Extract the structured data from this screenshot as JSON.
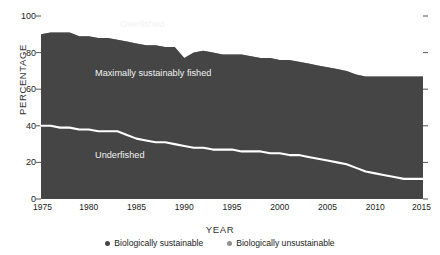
{
  "chart_data": {
    "type": "area",
    "title": "",
    "xlabel": "YEAR",
    "ylabel": "PERCENTAGE",
    "xlim": [
      1975,
      2015
    ],
    "ylim": [
      0,
      100
    ],
    "grid": false,
    "legend_position": "bottom",
    "x": [
      1975,
      1976,
      1977,
      1978,
      1979,
      1980,
      1981,
      1982,
      1983,
      1984,
      1985,
      1986,
      1987,
      1988,
      1989,
      1990,
      1991,
      1992,
      1993,
      1994,
      1995,
      1996,
      1997,
      1998,
      1999,
      2000,
      2001,
      2002,
      2003,
      2004,
      2005,
      2006,
      2007,
      2008,
      2009,
      2010,
      2011,
      2012,
      2013,
      2014,
      2015
    ],
    "xticks": [
      1975,
      1980,
      1985,
      1990,
      1995,
      2000,
      2005,
      2010,
      2015
    ],
    "xtick_labels": [
      "1975",
      "1980",
      "1985",
      "1990",
      "1995",
      "2000",
      "2005",
      "2010",
      "2015"
    ],
    "yticks": [
      0,
      20,
      40,
      60,
      80,
      100
    ],
    "ytick_labels": [
      "0",
      "20",
      "40",
      "60",
      "80",
      "100"
    ],
    "series": [
      {
        "name": "Underfished",
        "label_in_chart": "Underfished",
        "color": "#454545",
        "values": [
          40,
          40,
          39,
          39,
          38,
          38,
          37,
          37,
          37,
          35,
          33,
          32,
          31,
          31,
          30,
          29,
          28,
          28,
          27,
          27,
          27,
          26,
          26,
          26,
          25,
          25,
          24,
          24,
          23,
          22,
          21,
          20,
          19,
          17,
          15,
          14,
          13,
          12,
          11,
          11,
          11
        ]
      },
      {
        "name": "Maximally sustainably fished",
        "label_in_chart": "Maximally sustainably fished",
        "color": "#454545",
        "values": [
          50,
          51,
          52,
          52,
          51,
          51,
          51,
          51,
          50,
          51,
          52,
          52,
          53,
          52,
          53,
          48,
          52,
          53,
          53,
          52,
          52,
          53,
          52,
          51,
          52,
          51,
          52,
          51,
          51,
          51,
          51,
          51,
          51,
          51,
          52,
          53,
          54,
          55,
          56,
          56,
          56
        ]
      },
      {
        "name": "Overfished",
        "label_in_chart": "Overfished",
        "color": "#8f8f8f",
        "values": [
          10,
          9,
          9,
          9,
          11,
          11,
          12,
          12,
          13,
          14,
          15,
          16,
          16,
          17,
          17,
          23,
          20,
          19,
          20,
          21,
          21,
          21,
          22,
          23,
          23,
          24,
          24,
          25,
          26,
          27,
          28,
          29,
          30,
          32,
          33,
          33,
          33,
          33,
          33,
          33,
          33
        ]
      }
    ],
    "cumulative_upper_boundary": [
      90,
      91,
      91,
      91,
      89,
      89,
      88,
      88,
      87,
      86,
      85,
      84,
      84,
      83,
      83,
      77,
      80,
      81,
      80,
      79,
      79,
      79,
      78,
      77,
      77,
      76,
      76,
      75,
      74,
      73,
      72,
      71,
      70,
      68,
      67,
      67,
      67,
      67,
      67,
      67,
      67
    ],
    "underfished_boundary_line": {
      "color": "#ffffff",
      "values": [
        40,
        40,
        39,
        39,
        38,
        38,
        37,
        37,
        37,
        35,
        33,
        32,
        31,
        31,
        30,
        29,
        28,
        28,
        27,
        27,
        27,
        26,
        26,
        26,
        25,
        25,
        24,
        24,
        23,
        22,
        21,
        20,
        19,
        17,
        15,
        14,
        13,
        12,
        11,
        11,
        11
      ]
    },
    "legend": [
      {
        "label": "Biologically sustainable",
        "color": "#454545"
      },
      {
        "label": "Biologically unsustainable",
        "color": "#8f8f8f"
      }
    ]
  },
  "labels": {
    "overfished": "Overfished",
    "maximally": "Maximally sustainably fished",
    "underfished": "Underfished"
  }
}
